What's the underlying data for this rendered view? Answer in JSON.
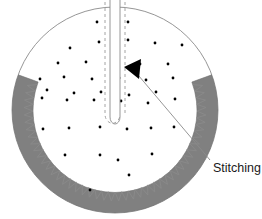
{
  "figure": {
    "width": 262,
    "height": 219,
    "background_color": "#ffffff"
  },
  "colors": {
    "band_fill": "#808080",
    "band_stroke": "#6e6e6e",
    "outline": "#8a8a8a",
    "zigzag": "#8a8a8a",
    "dot": "#000000",
    "arrow": "#000000",
    "leader_line": "#8a8a8a",
    "text": "#1a1a1a"
  },
  "shapes": {
    "outer_circle": {
      "cx": 115,
      "cy": 110,
      "r": 103
    },
    "inner_circle": {
      "cx": 115,
      "cy": 110,
      "r": 82
    },
    "band": {
      "label": "gray-annulus-band",
      "start_angle_deg": 200,
      "end_angle_deg": 340,
      "description": "gray annular band around lower portion of circle"
    },
    "slit": {
      "label": "center-slit",
      "x": 110,
      "top_y": 0,
      "bottom_y": 124,
      "width": 10,
      "rounded_bottom": true
    },
    "stitch_dashes": {
      "left_x": 105,
      "right_x": 125,
      "top_y": 2,
      "bottom_y": 122,
      "dash_pattern": "3,3"
    },
    "zigzag": {
      "label": "zigzag-stitch",
      "teeth": 46,
      "amplitude": 9,
      "radius": 82,
      "start_angle_deg": 198,
      "end_angle_deg": 342
    }
  },
  "callout": {
    "label": "Stitching",
    "text_x": 213,
    "text_y": 168,
    "leader_from": {
      "x": 210,
      "y": 160
    },
    "leader_to": {
      "x": 133,
      "y": 69
    },
    "arrow": {
      "tip_x": 124,
      "tip_y": 67,
      "description": "filled black triangular arrowhead pointing left"
    }
  },
  "dots": {
    "description": "scattered fabric texture dots",
    "radius": 1.4,
    "count": 39,
    "points": [
      [
        97,
        22
      ],
      [
        128,
        22
      ],
      [
        70,
        48
      ],
      [
        99,
        42
      ],
      [
        128,
        40
      ],
      [
        155,
        43
      ],
      [
        182,
        45
      ],
      [
        58,
        63
      ],
      [
        86,
        62
      ],
      [
        113,
        58
      ],
      [
        140,
        64
      ],
      [
        168,
        64
      ],
      [
        40,
        79
      ],
      [
        64,
        77
      ],
      [
        92,
        79
      ],
      [
        119,
        78
      ],
      [
        146,
        80
      ],
      [
        173,
        78
      ],
      [
        47,
        90
      ],
      [
        74,
        93
      ],
      [
        101,
        92
      ],
      [
        129,
        95
      ],
      [
        156,
        92
      ],
      [
        42,
        98
      ],
      [
        67,
        100
      ],
      [
        94,
        100
      ],
      [
        121,
        101
      ],
      [
        148,
        103
      ],
      [
        175,
        99
      ],
      [
        43,
        129
      ],
      [
        69,
        128
      ],
      [
        100,
        127
      ],
      [
        127,
        129
      ],
      [
        151,
        128
      ],
      [
        174,
        127
      ],
      [
        65,
        155
      ],
      [
        100,
        155
      ],
      [
        118,
        160
      ],
      [
        152,
        154
      ],
      [
        90,
        190
      ],
      [
        129,
        175
      ]
    ]
  }
}
